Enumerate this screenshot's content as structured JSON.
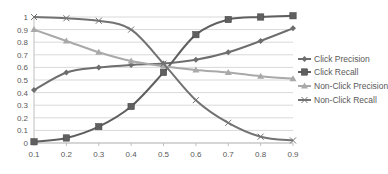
{
  "chart_data": {
    "type": "line",
    "title": "",
    "xlabel": "",
    "ylabel": "",
    "x": [
      0.1,
      0.2,
      0.3,
      0.4,
      0.5,
      0.6,
      0.7,
      0.8,
      0.9
    ],
    "x_tick_labels": [
      "0.1",
      "0.2",
      "0.3",
      "0.4",
      "0.5",
      "0.6",
      "0.7",
      "0.8",
      "0.9"
    ],
    "y_tick_labels": [
      "0",
      "0.1",
      "0.2",
      "0.3",
      "0.4",
      "0.5",
      "0.6",
      "0.7",
      "0.8",
      "0.9",
      "1"
    ],
    "ylim": [
      0,
      1
    ],
    "grid": "horizontal",
    "legend_position": "right",
    "series": [
      {
        "name": "Click Precision",
        "marker": "diamond",
        "color": "#6e6e6e",
        "values": [
          0.42,
          0.56,
          0.6,
          0.62,
          0.63,
          0.66,
          0.72,
          0.81,
          0.91
        ]
      },
      {
        "name": "Click Recall",
        "marker": "square",
        "color": "#5f5f5f",
        "values": [
          0.01,
          0.04,
          0.13,
          0.29,
          0.56,
          0.86,
          0.98,
          1.0,
          1.01
        ]
      },
      {
        "name": "Non-Click Precision",
        "marker": "triangle",
        "color": "#a9a9a9",
        "values": [
          0.9,
          0.81,
          0.72,
          0.65,
          0.61,
          0.58,
          0.56,
          0.53,
          0.51
        ]
      },
      {
        "name": "Non-Click Recall",
        "marker": "cross",
        "color": "#727272",
        "values": [
          1.0,
          0.99,
          0.97,
          0.9,
          0.63,
          0.34,
          0.16,
          0.05,
          0.02
        ]
      }
    ]
  }
}
